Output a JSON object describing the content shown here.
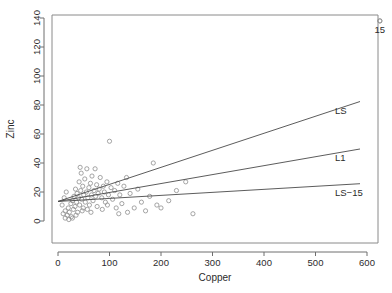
{
  "chart_data": {
    "type": "scatter",
    "title": "",
    "xlabel": "Copper",
    "ylabel": "Zinc",
    "xlim": [
      -15,
      650
    ],
    "ylim": [
      -4,
      146
    ],
    "xticks": [
      0,
      100,
      200,
      300,
      400,
      500,
      600
    ],
    "yticks": [
      0,
      20,
      40,
      60,
      80,
      100,
      120,
      140
    ],
    "grid": false,
    "legend_position": "inline-right-of-lines",
    "marker": "open-circle",
    "points": [
      {
        "x": 10,
        "y": 5
      },
      {
        "x": 14,
        "y": 7
      },
      {
        "x": 18,
        "y": 4
      },
      {
        "x": 20,
        "y": 9
      },
      {
        "x": 22,
        "y": 6
      },
      {
        "x": 25,
        "y": 12
      },
      {
        "x": 26,
        "y": 3
      },
      {
        "x": 28,
        "y": 14
      },
      {
        "x": 30,
        "y": 8
      },
      {
        "x": 31,
        "y": 17
      },
      {
        "x": 33,
        "y": 10
      },
      {
        "x": 34,
        "y": 22
      },
      {
        "x": 36,
        "y": 13
      },
      {
        "x": 37,
        "y": 19
      },
      {
        "x": 38,
        "y": 6
      },
      {
        "x": 40,
        "y": 16
      },
      {
        "x": 41,
        "y": 27
      },
      {
        "x": 42,
        "y": 11
      },
      {
        "x": 44,
        "y": 21
      },
      {
        "x": 45,
        "y": 33
      },
      {
        "x": 46,
        "y": 15
      },
      {
        "x": 48,
        "y": 24
      },
      {
        "x": 49,
        "y": 9
      },
      {
        "x": 50,
        "y": 18
      },
      {
        "x": 52,
        "y": 29
      },
      {
        "x": 53,
        "y": 13
      },
      {
        "x": 55,
        "y": 20
      },
      {
        "x": 56,
        "y": 36
      },
      {
        "x": 58,
        "y": 16
      },
      {
        "x": 60,
        "y": 23
      },
      {
        "x": 61,
        "y": 11
      },
      {
        "x": 63,
        "y": 26
      },
      {
        "x": 65,
        "y": 18
      },
      {
        "x": 66,
        "y": 31
      },
      {
        "x": 68,
        "y": 14
      },
      {
        "x": 70,
        "y": 21
      },
      {
        "x": 72,
        "y": 36
      },
      {
        "x": 73,
        "y": 17
      },
      {
        "x": 75,
        "y": 25
      },
      {
        "x": 78,
        "y": 19
      },
      {
        "x": 80,
        "y": 22
      },
      {
        "x": 82,
        "y": 30
      },
      {
        "x": 85,
        "y": 16
      },
      {
        "x": 88,
        "y": 24
      },
      {
        "x": 90,
        "y": 20
      },
      {
        "x": 92,
        "y": 13
      },
      {
        "x": 95,
        "y": 27
      },
      {
        "x": 98,
        "y": 18
      },
      {
        "x": 100,
        "y": 55
      },
      {
        "x": 103,
        "y": 23
      },
      {
        "x": 106,
        "y": 15
      },
      {
        "x": 110,
        "y": 21
      },
      {
        "x": 113,
        "y": 9
      },
      {
        "x": 116,
        "y": 26
      },
      {
        "x": 120,
        "y": 18
      },
      {
        "x": 124,
        "y": 12
      },
      {
        "x": 128,
        "y": 24
      },
      {
        "x": 133,
        "y": 30
      },
      {
        "x": 140,
        "y": 19
      },
      {
        "x": 148,
        "y": 9
      },
      {
        "x": 155,
        "y": 22
      },
      {
        "x": 162,
        "y": 13
      },
      {
        "x": 170,
        "y": 7
      },
      {
        "x": 178,
        "y": 17
      },
      {
        "x": 185,
        "y": 40
      },
      {
        "x": 192,
        "y": 11
      },
      {
        "x": 200,
        "y": 9
      },
      {
        "x": 215,
        "y": 14
      },
      {
        "x": 230,
        "y": 21
      },
      {
        "x": 248,
        "y": 27
      },
      {
        "x": 262,
        "y": 5
      },
      {
        "x": 14,
        "y": 2
      },
      {
        "x": 21,
        "y": 1
      },
      {
        "x": 28,
        "y": 2
      },
      {
        "x": 35,
        "y": 4
      },
      {
        "x": 8,
        "y": 11
      },
      {
        "x": 12,
        "y": 16
      },
      {
        "x": 16,
        "y": 20
      },
      {
        "x": 43,
        "y": 37
      },
      {
        "x": 47,
        "y": 7
      },
      {
        "x": 57,
        "y": 8
      },
      {
        "x": 64,
        "y": 6
      },
      {
        "x": 76,
        "y": 10
      },
      {
        "x": 86,
        "y": 8
      },
      {
        "x": 96,
        "y": 11
      },
      {
        "x": 118,
        "y": 5
      },
      {
        "x": 135,
        "y": 6
      },
      {
        "x": 625,
        "y": 138
      }
    ],
    "outlier": {
      "x": 625,
      "y": 138,
      "label": "15"
    },
    "series": [
      {
        "name": "LS",
        "type": "line",
        "label": "LS",
        "x": [
          0,
          600
        ],
        "y": [
          13.5,
          84.0
        ]
      },
      {
        "name": "L1",
        "type": "line",
        "label": "L1",
        "x": [
          0,
          600
        ],
        "y": [
          13.5,
          50.5
        ]
      },
      {
        "name": "LS-15",
        "type": "line",
        "label": "LS−15",
        "x": [
          0,
          600
        ],
        "y": [
          13.5,
          26.0
        ]
      }
    ]
  },
  "axis": {
    "x_title": "Copper",
    "y_title": "Zinc",
    "x_tick_labels": [
      "0",
      "100",
      "200",
      "300",
      "400",
      "500",
      "600"
    ],
    "y_tick_labels": [
      "0",
      "20",
      "40",
      "60",
      "80",
      "100",
      "120",
      "140"
    ]
  },
  "labels": {
    "ls": "LS",
    "l1": "L1",
    "ls15": "LS−15",
    "point15": "15"
  },
  "colors": {
    "axis": "#6e6e6e",
    "frame": "#8a8a8a",
    "line": "#4a4a4a",
    "marker": "#8e8e8e",
    "text": "#2b2b2b",
    "background": "#ffffff"
  }
}
